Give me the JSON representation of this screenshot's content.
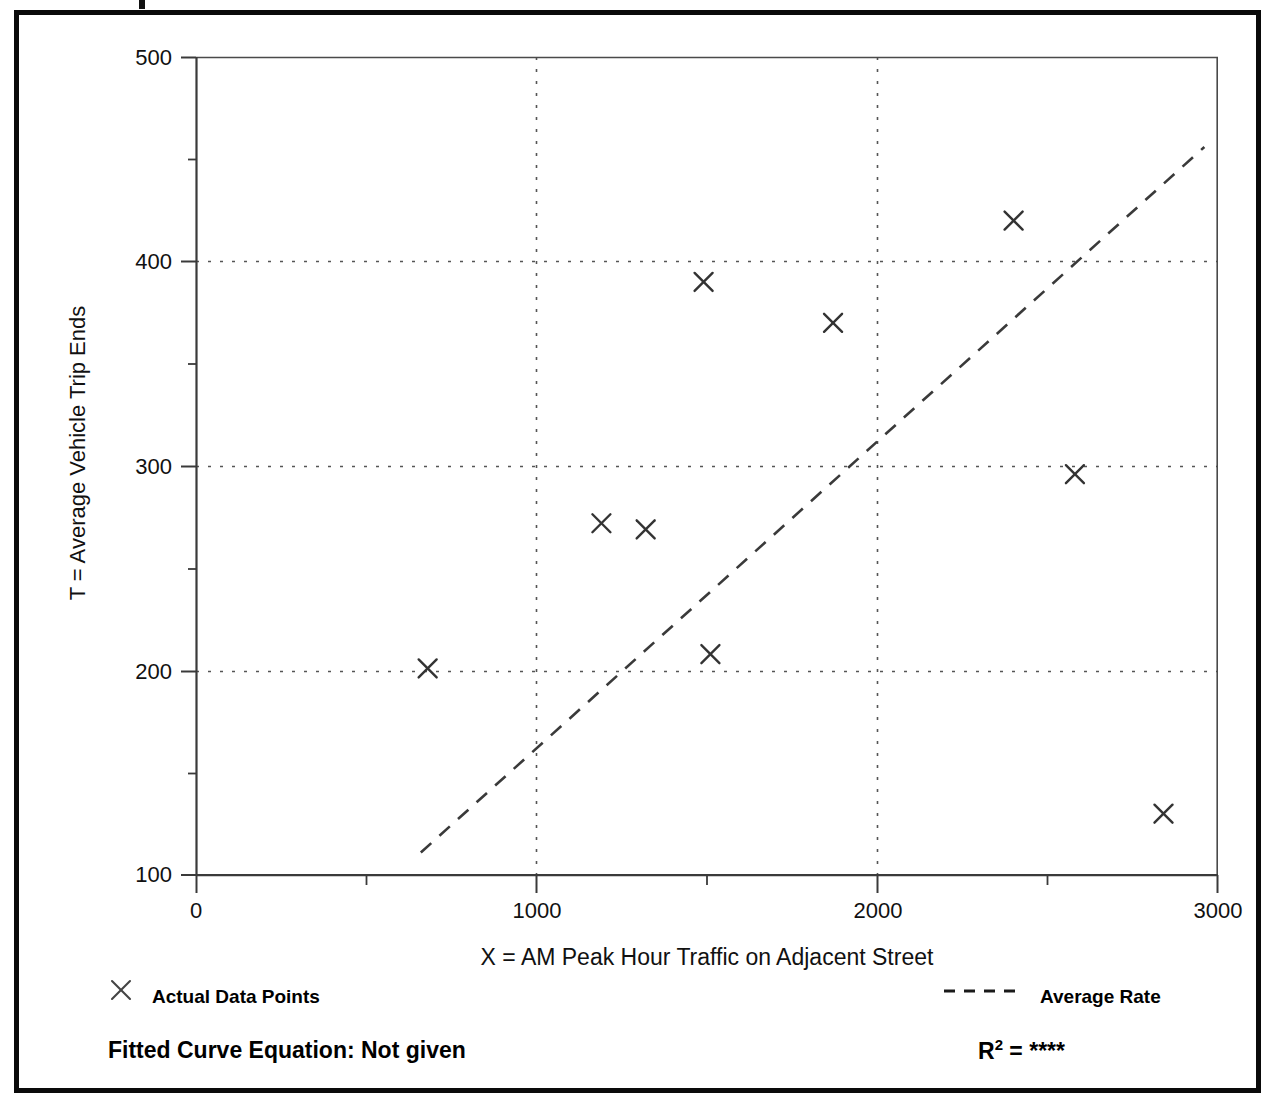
{
  "figure": {
    "top_clipped_mark": "|",
    "frame_color": "#0a0a0a"
  },
  "chart_data": {
    "type": "scatter",
    "title": "",
    "xlabel": "X = AM Peak Hour Traffic on Adjacent Street",
    "ylabel": "T = Average Vehicle Trip Ends",
    "xlim": [
      0,
      3000
    ],
    "ylim": [
      100,
      500
    ],
    "xticks": [
      0,
      1000,
      2000,
      3000
    ],
    "xtick_labels": [
      "0",
      "1000",
      "2000",
      "3000"
    ],
    "xminor_ticks": [
      500,
      1500,
      2500
    ],
    "yticks": [
      100,
      200,
      300,
      400,
      500
    ],
    "ytick_labels": [
      "100",
      "200",
      "300",
      "400",
      "500"
    ],
    "yminor_ticks": [
      150,
      250,
      350,
      450
    ],
    "grid": "dotted major gridlines at y=200,300,400 and x=1000,2000",
    "grid_color": "#555555",
    "legend_position": "below-axes",
    "series": [
      {
        "name": "Actual Data Points",
        "type": "scatter",
        "marker": "x",
        "color": "#333333",
        "points": [
          {
            "x": 680,
            "y": 201
          },
          {
            "x": 1190,
            "y": 272
          },
          {
            "x": 1320,
            "y": 269
          },
          {
            "x": 1490,
            "y": 390
          },
          {
            "x": 1510,
            "y": 208
          },
          {
            "x": 1870,
            "y": 370
          },
          {
            "x": 2400,
            "y": 420
          },
          {
            "x": 2580,
            "y": 296
          },
          {
            "x": 2840,
            "y": 130
          }
        ]
      },
      {
        "name": "Average Rate",
        "type": "line",
        "style": "dashed",
        "color": "#333333",
        "endpoints": [
          {
            "x": 660,
            "y": 111
          },
          {
            "x": 2960,
            "y": 456
          }
        ]
      }
    ],
    "annotations": {
      "fitted_curve_equation_label": "Fitted Curve Equation:",
      "fitted_curve_equation_value": "Not given",
      "r2_label": "R",
      "r2_exponent": "2",
      "r2_equals": "=",
      "r2_value": "****"
    }
  },
  "legend": {
    "left": {
      "marker": "x-marker-icon",
      "label": "Actual Data Points"
    },
    "right": {
      "marker": "dashed-line-icon",
      "label": "Average Rate"
    }
  },
  "footer": {
    "left_text": "Fitted Curve Equation:  Not given",
    "right_prefix": "R",
    "right_sup": "2",
    "right_rest": " = ",
    "right_value": "****"
  }
}
